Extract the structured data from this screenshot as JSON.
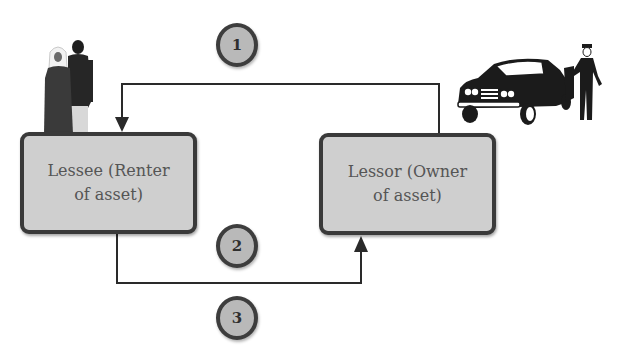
{
  "diagram": {
    "type": "lease-flow",
    "parties": {
      "lessee": {
        "line1": "Lessee (Renter",
        "line2": "of asset)"
      },
      "lessor": {
        "line1": "Lessor (Owner",
        "line2": "of asset)"
      }
    },
    "steps": [
      {
        "label": "1",
        "from": "lessor",
        "to": "lessee"
      },
      {
        "label": "2",
        "from": "lessee",
        "to": "lessor"
      },
      {
        "label": "3",
        "from": "lessee",
        "to": "lessor"
      }
    ],
    "illustrations": {
      "lessee": "couple-illustration",
      "lessor": "car-with-chauffeur-illustration"
    },
    "colors": {
      "box_fill": "#cfcfcf",
      "box_border": "#3a3a3a",
      "circle_fill": "#b9b9b9",
      "line": "#2a2a2a",
      "text": "#555555"
    }
  }
}
